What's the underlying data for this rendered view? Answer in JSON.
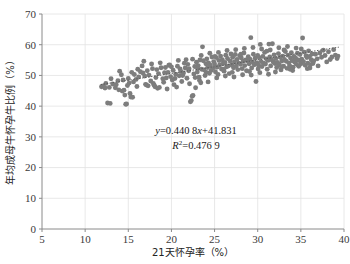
{
  "chart_data": {
    "type": "scatter",
    "title": "",
    "xlabel": "21天怀孕率（%）",
    "ylabel": "年均成母牛怀孕牛比例（%）",
    "xlim": [
      5,
      40
    ],
    "ylim": [
      0,
      70
    ],
    "xticks": [
      5,
      10,
      15,
      20,
      25,
      30,
      35,
      40
    ],
    "yticks": [
      0,
      10,
      20,
      30,
      40,
      50,
      60,
      70
    ],
    "grid": true,
    "legend": "none",
    "marker_color": "#7d7d7d",
    "trendline": {
      "type": "linear-dotted",
      "slope": 0.4408,
      "intercept": 41.831,
      "r_squared": 0.4769,
      "equation_label": "y=0.440 8x+41.831",
      "r2_label": "R²=0.476 9",
      "x_start": 11.8,
      "x_end": 39.4
    },
    "points": [
      [
        11.9,
        46.3
      ],
      [
        12.1,
        46.6
      ],
      [
        12.3,
        45.9
      ],
      [
        12.6,
        41.0
      ],
      [
        12.9,
        40.9
      ],
      [
        13.2,
        47.2
      ],
      [
        13.5,
        46.0
      ],
      [
        13.8,
        48.3
      ],
      [
        14.0,
        51.4
      ],
      [
        14.2,
        50.2
      ],
      [
        14.3,
        44.9
      ],
      [
        14.5,
        45.2
      ],
      [
        14.6,
        43.6
      ],
      [
        14.7,
        40.6
      ],
      [
        14.8,
        40.7
      ],
      [
        15.0,
        49.0
      ],
      [
        15.1,
        47.5
      ],
      [
        15.2,
        44.1
      ],
      [
        15.3,
        43.0
      ],
      [
        15.5,
        42.9
      ],
      [
        15.7,
        50.3
      ],
      [
        15.9,
        48.7
      ],
      [
        16.0,
        46.4
      ],
      [
        16.2,
        49.5
      ],
      [
        16.4,
        51.2
      ],
      [
        16.6,
        53.1
      ],
      [
        16.8,
        54.6
      ],
      [
        16.9,
        49.8
      ],
      [
        17.0,
        47.1
      ],
      [
        17.1,
        46.9
      ],
      [
        17.3,
        46.6
      ],
      [
        17.4,
        50.1
      ],
      [
        17.6,
        48.2
      ],
      [
        17.8,
        52.2
      ],
      [
        17.9,
        47.4
      ],
      [
        18.0,
        46.8
      ],
      [
        18.1,
        46.3
      ],
      [
        18.2,
        49.3
      ],
      [
        18.4,
        45.8
      ],
      [
        18.5,
        50.6
      ],
      [
        18.6,
        46.1
      ],
      [
        18.8,
        52.5
      ],
      [
        19.0,
        48.9
      ],
      [
        19.1,
        47.8
      ],
      [
        19.2,
        50.9
      ],
      [
        19.4,
        49.2
      ],
      [
        19.5,
        45.6
      ],
      [
        19.6,
        51.0
      ],
      [
        19.8,
        53.4
      ],
      [
        19.9,
        49.6
      ],
      [
        20.0,
        52.8
      ],
      [
        20.1,
        48.5
      ],
      [
        20.2,
        51.7
      ],
      [
        20.3,
        47.0
      ],
      [
        20.5,
        50.4
      ],
      [
        20.6,
        46.2
      ],
      [
        20.7,
        53.0
      ],
      [
        20.9,
        49.9
      ],
      [
        21.0,
        52.1
      ],
      [
        21.1,
        51.3
      ],
      [
        21.2,
        48.0
      ],
      [
        21.4,
        50.8
      ],
      [
        21.5,
        54.0
      ],
      [
        21.6,
        52.4
      ],
      [
        21.8,
        49.1
      ],
      [
        21.9,
        53.6
      ],
      [
        22.0,
        51.5
      ],
      [
        22.1,
        47.3
      ],
      [
        22.2,
        41.4
      ],
      [
        22.3,
        41.8
      ],
      [
        22.4,
        43.2
      ],
      [
        22.5,
        43.5
      ],
      [
        22.6,
        50.5
      ],
      [
        22.7,
        52.9
      ],
      [
        22.8,
        46.0
      ],
      [
        22.9,
        54.3
      ],
      [
        23.0,
        51.1
      ],
      [
        23.1,
        53.2
      ],
      [
        23.2,
        49.4
      ],
      [
        23.3,
        55.0
      ],
      [
        23.4,
        47.6
      ],
      [
        23.5,
        52.0
      ],
      [
        23.6,
        59.3
      ],
      [
        23.7,
        54.8
      ],
      [
        23.8,
        51.8
      ],
      [
        23.9,
        50.0
      ],
      [
        24.0,
        53.8
      ],
      [
        24.1,
        55.4
      ],
      [
        24.2,
        52.6
      ],
      [
        24.3,
        54.1
      ],
      [
        24.4,
        50.7
      ],
      [
        24.5,
        53.3
      ],
      [
        24.6,
        51.6
      ],
      [
        24.7,
        56.0
      ],
      [
        24.8,
        52.3
      ],
      [
        24.9,
        54.5
      ],
      [
        25.0,
        53.7
      ],
      [
        25.1,
        51.2
      ],
      [
        25.2,
        55.8
      ],
      [
        25.3,
        52.7
      ],
      [
        25.4,
        50.3
      ],
      [
        25.5,
        54.9
      ],
      [
        25.6,
        53.5
      ],
      [
        25.7,
        56.3
      ],
      [
        25.8,
        52.1
      ],
      [
        25.9,
        55.1
      ],
      [
        26.0,
        53.9
      ],
      [
        26.1,
        51.4
      ],
      [
        26.2,
        54.2
      ],
      [
        26.3,
        56.6
      ],
      [
        26.4,
        52.8
      ],
      [
        26.5,
        55.5
      ],
      [
        26.6,
        53.1
      ],
      [
        26.7,
        50.6
      ],
      [
        26.8,
        54.7
      ],
      [
        26.9,
        57.0
      ],
      [
        27.0,
        53.4
      ],
      [
        27.1,
        55.9
      ],
      [
        27.2,
        52.5
      ],
      [
        27.3,
        54.4
      ],
      [
        27.4,
        56.8
      ],
      [
        27.5,
        53.0
      ],
      [
        27.6,
        55.2
      ],
      [
        27.7,
        51.9
      ],
      [
        27.8,
        54.0
      ],
      [
        27.9,
        56.4
      ],
      [
        28.0,
        53.6
      ],
      [
        28.1,
        55.7
      ],
      [
        28.2,
        52.2
      ],
      [
        28.3,
        54.6
      ],
      [
        28.4,
        57.3
      ],
      [
        28.5,
        53.2
      ],
      [
        28.6,
        55.0
      ],
      [
        28.7,
        51.5
      ],
      [
        28.8,
        54.8
      ],
      [
        28.9,
        56.1
      ],
      [
        29.0,
        53.8
      ],
      [
        29.1,
        55.3
      ],
      [
        29.2,
        62.3
      ],
      [
        29.3,
        52.4
      ],
      [
        29.4,
        54.3
      ],
      [
        29.5,
        56.9
      ],
      [
        29.6,
        53.5
      ],
      [
        29.7,
        55.6
      ],
      [
        29.8,
        48.0
      ],
      [
        29.9,
        54.1
      ],
      [
        30.0,
        56.5
      ],
      [
        30.1,
        53.3
      ],
      [
        30.2,
        55.8
      ],
      [
        30.3,
        60.1
      ],
      [
        30.4,
        54.5
      ],
      [
        30.5,
        52.9
      ],
      [
        30.6,
        56.2
      ],
      [
        30.7,
        54.0
      ],
      [
        30.8,
        57.5
      ],
      [
        30.9,
        53.7
      ],
      [
        31.0,
        55.4
      ],
      [
        31.1,
        52.0
      ],
      [
        31.2,
        54.9
      ],
      [
        31.3,
        60.2
      ],
      [
        31.4,
        56.0
      ],
      [
        31.5,
        53.1
      ],
      [
        31.6,
        55.1
      ],
      [
        31.7,
        60.3
      ],
      [
        31.8,
        54.4
      ],
      [
        31.9,
        56.7
      ],
      [
        32.0,
        53.9
      ],
      [
        32.1,
        55.5
      ],
      [
        32.2,
        52.6
      ],
      [
        32.3,
        54.2
      ],
      [
        32.4,
        57.1
      ],
      [
        32.5,
        53.4
      ],
      [
        32.6,
        55.9
      ],
      [
        32.7,
        51.8
      ],
      [
        32.8,
        54.7
      ],
      [
        32.9,
        56.3
      ],
      [
        33.0,
        53.0
      ],
      [
        33.1,
        55.2
      ],
      [
        33.2,
        57.8
      ],
      [
        33.3,
        54.6
      ],
      [
        33.4,
        52.3
      ],
      [
        33.5,
        56.6
      ],
      [
        33.6,
        54.1
      ],
      [
        33.7,
        53.2
      ],
      [
        33.8,
        55.7
      ],
      [
        33.9,
        57.4
      ],
      [
        34.0,
        54.8
      ],
      [
        34.1,
        52.7
      ],
      [
        34.2,
        56.1
      ],
      [
        34.3,
        54.3
      ],
      [
        34.4,
        55.6
      ],
      [
        34.5,
        53.6
      ],
      [
        34.6,
        57.2
      ],
      [
        34.7,
        55.0
      ],
      [
        34.8,
        54.9
      ],
      [
        34.9,
        56.8
      ],
      [
        35.0,
        53.8
      ],
      [
        35.1,
        55.3
      ],
      [
        35.2,
        62.2
      ],
      [
        35.3,
        54.5
      ],
      [
        35.4,
        57.6
      ],
      [
        35.5,
        53.3
      ],
      [
        35.6,
        56.4
      ],
      [
        35.7,
        55.8
      ],
      [
        35.8,
        54.0
      ],
      [
        35.9,
        58.0
      ],
      [
        36.0,
        56.2
      ],
      [
        36.1,
        53.5
      ],
      [
        36.2,
        55.1
      ],
      [
        36.3,
        57.0
      ],
      [
        36.5,
        54.7
      ],
      [
        36.7,
        56.9
      ],
      [
        36.9,
        55.4
      ],
      [
        37.0,
        53.1
      ],
      [
        37.2,
        57.3
      ],
      [
        37.4,
        55.9
      ],
      [
        37.6,
        58.2
      ],
      [
        37.8,
        56.5
      ],
      [
        38.0,
        54.4
      ],
      [
        38.2,
        57.7
      ],
      [
        38.4,
        55.2
      ],
      [
        38.6,
        56.0
      ],
      [
        38.8,
        58.4
      ],
      [
        39.0,
        56.6
      ],
      [
        39.2,
        55.5
      ],
      [
        39.3,
        56.3
      ],
      [
        13.0,
        48.9
      ],
      [
        13.6,
        47.0
      ],
      [
        14.9,
        46.7
      ],
      [
        16.1,
        52.0
      ],
      [
        17.2,
        51.5
      ],
      [
        18.3,
        51.9
      ],
      [
        19.3,
        52.6
      ],
      [
        20.4,
        49.0
      ],
      [
        21.3,
        50.0
      ],
      [
        22.05,
        52.2
      ],
      [
        23.05,
        52.3
      ],
      [
        24.05,
        51.0
      ],
      [
        25.05,
        56.2
      ],
      [
        26.05,
        52.0
      ],
      [
        27.05,
        51.0
      ],
      [
        28.05,
        56.9
      ],
      [
        29.05,
        51.3
      ],
      [
        30.05,
        52.1
      ],
      [
        31.05,
        57.9
      ],
      [
        32.05,
        51.1
      ],
      [
        33.05,
        58.3
      ],
      [
        34.05,
        51.6
      ],
      [
        35.05,
        58.6
      ],
      [
        36.05,
        52.4
      ],
      [
        20.8,
        54.9
      ],
      [
        21.7,
        55.1
      ],
      [
        22.45,
        55.3
      ],
      [
        23.45,
        56.5
      ],
      [
        24.45,
        57.2
      ],
      [
        25.45,
        57.5
      ],
      [
        26.45,
        58.1
      ],
      [
        27.45,
        58.4
      ],
      [
        28.45,
        58.8
      ],
      [
        29.45,
        59.1
      ],
      [
        30.45,
        58.6
      ],
      [
        31.45,
        58.3
      ],
      [
        32.45,
        59.0
      ],
      [
        33.45,
        59.4
      ],
      [
        34.45,
        58.9
      ],
      [
        18.7,
        54.1
      ],
      [
        19.7,
        53.3
      ],
      [
        17.7,
        53.7
      ],
      [
        16.7,
        50.8
      ],
      [
        15.6,
        47.9
      ],
      [
        15.4,
        51.0
      ],
      [
        14.4,
        48.5
      ],
      [
        13.9,
        45.3
      ],
      [
        12.4,
        47.4
      ],
      [
        12.8,
        46.1
      ],
      [
        24.25,
        47.9
      ],
      [
        23.25,
        48.4
      ],
      [
        25.25,
        49.2
      ],
      [
        26.25,
        49.8
      ],
      [
        27.25,
        49.5
      ],
      [
        28.25,
        50.2
      ],
      [
        29.25,
        50.1
      ],
      [
        30.25,
        50.9
      ],
      [
        31.25,
        50.4
      ],
      [
        22.75,
        49.3
      ],
      [
        33.75,
        52.0
      ],
      [
        32.75,
        52.8
      ],
      [
        34.75,
        53.0
      ],
      [
        35.75,
        52.2
      ],
      [
        36.4,
        53.9
      ]
    ]
  }
}
